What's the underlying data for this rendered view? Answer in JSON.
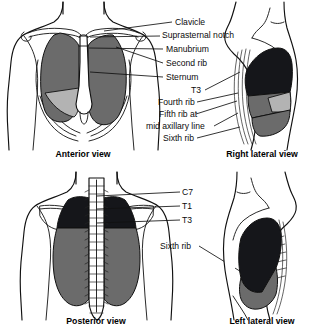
{
  "diagram": {
    "colors": {
      "lung_mid_gray": "#6b6b6b",
      "lung_dark": "#15161a",
      "lung_light_gray": "#b3b3b3",
      "outline": "#111111",
      "background": "#ffffff",
      "text": "#0b0b0b"
    },
    "panels": [
      {
        "id": "anterior",
        "caption": "Anterior view",
        "caption_x": 83,
        "caption_y": 155
      },
      {
        "id": "right-lateral",
        "caption": "Right lateral view",
        "caption_x": 262,
        "caption_y": 155
      },
      {
        "id": "posterior",
        "caption": "Posterior view",
        "caption_x": 96,
        "caption_y": 322
      },
      {
        "id": "left-lateral",
        "caption": "Left lateral view",
        "caption_x": 262,
        "caption_y": 322
      }
    ],
    "labels_top": [
      {
        "id": "clavicle",
        "text": "Clavicle",
        "x": 175,
        "y": 25,
        "anchor": "start"
      },
      {
        "id": "suprasternal-notch",
        "text": "Suprasternal notch",
        "x": 162,
        "y": 38,
        "anchor": "start"
      },
      {
        "id": "manubrium",
        "text": "Manubrium",
        "x": 166,
        "y": 52,
        "anchor": "start"
      },
      {
        "id": "second-rib",
        "text": "Second rib",
        "x": 166,
        "y": 66,
        "anchor": "start"
      },
      {
        "id": "sternum",
        "text": "Sternum",
        "x": 166,
        "y": 80,
        "anchor": "start"
      },
      {
        "id": "t3",
        "text": "T3",
        "x": 194,
        "y": 93,
        "anchor": "start"
      },
      {
        "id": "fourth-rib",
        "text": "Fourth rib",
        "x": 160,
        "y": 105,
        "anchor": "start"
      },
      {
        "id": "fifth-rib-at",
        "text": "Fifth rib at",
        "x": 160,
        "y": 117,
        "anchor": "start"
      },
      {
        "id": "mid-axillary-line",
        "text": "mid axillary line",
        "x": 148,
        "y": 129,
        "anchor": "start"
      },
      {
        "id": "sixth-rib",
        "text": "Sixth rib",
        "x": 166,
        "y": 141,
        "anchor": "start"
      }
    ],
    "labels_bottom": [
      {
        "id": "c7",
        "text": "C7",
        "x": 182,
        "y": 195,
        "anchor": "start"
      },
      {
        "id": "t1",
        "text": "T1",
        "x": 182,
        "y": 209,
        "anchor": "start"
      },
      {
        "id": "t3",
        "text": "T3",
        "x": 182,
        "y": 223,
        "anchor": "start"
      },
      {
        "id": "sixth-rib-left",
        "text": "Sixth rib",
        "x": 162,
        "y": 247,
        "anchor": "start"
      }
    ]
  }
}
